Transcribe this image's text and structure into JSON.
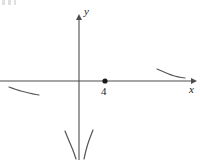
{
  "figure": {
    "background_color": "#ffffff",
    "stroke_color": "#4d4d4d",
    "curve_color": "#555555",
    "text_color": "#1a1a1a"
  },
  "axes": {
    "x_label": "x",
    "y_label": "y",
    "x_axis_y_pixel": 81,
    "y_axis_x_pixel": 79,
    "x_axis_start_x": 0,
    "x_axis_end_x": 194,
    "y_axis_start_y": 16,
    "y_axis_end_y": 160,
    "arrow_x_right": true,
    "arrow_y_up": true
  },
  "markers": {
    "point_label": "4",
    "point_x_pixel": 105,
    "point_y_pixel": 81,
    "point_radius": 2.6,
    "point_filled": true
  },
  "chart_data": {
    "type": "line",
    "xlabel": "x",
    "ylabel": "y",
    "grid": false,
    "legend": "none",
    "annotations": [
      {
        "text": "4",
        "x_pixel": 105,
        "y_pixel": 81,
        "marker": "filled-dot"
      }
    ],
    "series": [
      {
        "name": "left-branch-below-axis",
        "description": "Short concave fragment below the x-axis on the far left, descending to the right",
        "points_pixel": [
          [
            9,
            87
          ],
          [
            17,
            90
          ],
          [
            25,
            92
          ],
          [
            33,
            94
          ],
          [
            39,
            95
          ]
        ]
      },
      {
        "name": "right-branch-above-axis",
        "description": "Short fragment above the x-axis on the far right, descending to the right and flattening",
        "points_pixel": [
          [
            157,
            69
          ],
          [
            164,
            72
          ],
          [
            171,
            75
          ],
          [
            178,
            77
          ],
          [
            185,
            78
          ]
        ]
      },
      {
        "name": "asymptote-branch-left",
        "description": "Steep branch at the bottom left of the y-axis descending to the right toward the asymptote",
        "points_pixel": [
          [
            65,
            131
          ],
          [
            69,
            141
          ],
          [
            73,
            150
          ],
          [
            76,
            159
          ]
        ]
      },
      {
        "name": "asymptote-branch-right",
        "description": "Steep branch at the bottom right of the y-axis descending to the left toward the asymptote",
        "points_pixel": [
          [
            93,
            130
          ],
          [
            89,
            140
          ],
          [
            86,
            150
          ],
          [
            84,
            159
          ]
        ]
      }
    ]
  }
}
